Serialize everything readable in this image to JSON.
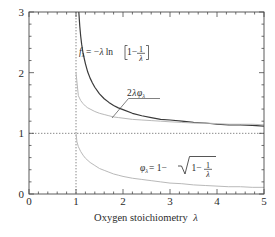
{
  "chart_data": {
    "type": "line",
    "title": "",
    "xlabel": "Oxygen stoichiometry λ",
    "ylabel": "",
    "xlim": [
      0,
      5
    ],
    "ylim": [
      0,
      3
    ],
    "xticks": [
      "0",
      "1",
      "2",
      "3",
      "4",
      "5"
    ],
    "yticks": [
      "0",
      "1",
      "2",
      "3"
    ],
    "xtick_values": [
      0,
      1,
      2,
      3,
      4,
      5
    ],
    "ytick_values": [
      0,
      1,
      2,
      3
    ],
    "xminor_step": 0.2,
    "yminor_step": 0.2,
    "grid": false,
    "legend_position": "inline-annotations",
    "reference_lines": [
      {
        "name": "lambda-equals-one",
        "orientation": "vertical",
        "value": 1,
        "style": "dotted"
      },
      {
        "name": "y-equals-one",
        "orientation": "horizontal",
        "value": 1,
        "style": "dotted"
      }
    ],
    "series": [
      {
        "name": "f_lambda",
        "label": "fλ = −λ ln[1 − 1/λ]",
        "color": "#3a3a3a",
        "width": 1.2,
        "x": [
          1.02,
          1.04,
          1.06,
          1.08,
          1.1,
          1.12,
          1.15,
          1.2,
          1.25,
          1.3,
          1.35,
          1.4,
          1.5,
          1.6,
          1.7,
          1.8,
          1.9,
          2.0,
          2.2,
          2.4,
          2.6,
          2.8,
          3.0,
          3.25,
          3.5,
          3.75,
          4.0,
          4.25,
          4.5,
          4.75,
          5.0
        ],
        "y": [
          3.99,
          3.35,
          3.0,
          2.77,
          2.6,
          2.47,
          2.32,
          2.15,
          2.01,
          1.91,
          1.83,
          1.76,
          1.65,
          1.57,
          1.51,
          1.46,
          1.42,
          1.39,
          1.33,
          1.29,
          1.26,
          1.23,
          1.22,
          1.2,
          1.18,
          1.17,
          1.15,
          1.14,
          1.14,
          1.13,
          1.12
        ]
      },
      {
        "name": "two-lambda-phi",
        "label": "2λφλ",
        "color": "#b9b9b9",
        "width": 1.0,
        "x": [
          1.0,
          1.05,
          1.1,
          1.15,
          1.2,
          1.25,
          1.3,
          1.4,
          1.5,
          1.6,
          1.7,
          1.8,
          1.9,
          2.0,
          2.2,
          2.4,
          2.6,
          2.8,
          3.0,
          3.25,
          3.5,
          3.75,
          4.0,
          4.25,
          4.5,
          4.75,
          5.0
        ],
        "y": [
          2.0,
          1.62,
          1.54,
          1.49,
          1.45,
          1.42,
          1.4,
          1.36,
          1.33,
          1.31,
          1.29,
          1.27,
          1.26,
          1.25,
          1.23,
          1.22,
          1.21,
          1.2,
          1.19,
          1.18,
          1.17,
          1.17,
          1.16,
          1.15,
          1.15,
          1.15,
          1.14
        ]
      },
      {
        "name": "phi_lambda",
        "label": "φλ = 1 − √(1 − 1/λ)",
        "color": "#b9b9b9",
        "width": 1.0,
        "x": [
          1.0,
          1.02,
          1.05,
          1.1,
          1.15,
          1.2,
          1.3,
          1.4,
          1.5,
          1.6,
          1.7,
          1.8,
          1.9,
          2.0,
          2.2,
          2.4,
          2.6,
          2.8,
          3.0,
          3.25,
          3.5,
          3.75,
          4.0,
          4.25,
          4.5,
          4.75,
          5.0
        ],
        "y": [
          1.0,
          0.86,
          0.78,
          0.7,
          0.64,
          0.59,
          0.52,
          0.47,
          0.42,
          0.39,
          0.36,
          0.33,
          0.31,
          0.29,
          0.26,
          0.24,
          0.22,
          0.2,
          0.18,
          0.17,
          0.15,
          0.14,
          0.13,
          0.12,
          0.12,
          0.11,
          0.11
        ]
      }
    ],
    "annotations": [
      {
        "name": "f-lambda-formula",
        "text": "fλ = −λ ln[1 − 1/λ]",
        "x": 1.25,
        "y": 2.45
      },
      {
        "name": "two-lambda-phi-formula",
        "text": "2λφλ",
        "x": 2.25,
        "y": 1.6
      },
      {
        "name": "phi-lambda-formula",
        "text": "φλ = 1 − √(1 − 1/λ)",
        "x": 3.05,
        "y": 0.52
      }
    ]
  },
  "axis": {
    "x_title": "Oxygen stoichiometry",
    "x_title_symbol": "λ",
    "xticks": [
      "0",
      "1",
      "2",
      "3",
      "4",
      "5"
    ],
    "yticks": [
      "0",
      "1",
      "2",
      "3"
    ]
  },
  "labels": {
    "f_lhs": "f",
    "f_sub": "λ",
    "f_eq": "= −",
    "f_lam": "λ",
    "f_ln": "ln",
    "f_one": "1−",
    "f_frac_num": "1",
    "f_frac_den": "λ",
    "mid_two": "2",
    "mid_lam": "λ",
    "mid_phi": "φ",
    "mid_sub": "λ",
    "phi_lhs": "φ",
    "phi_sub": "λ",
    "phi_eq": "= 1−",
    "phi_one": "1−",
    "phi_frac_num": "1",
    "phi_frac_den": "λ"
  },
  "colors": {
    "frame": "#4a4a4a",
    "dark_curve": "#3a3a3a",
    "light_curve": "#bcbcbc",
    "dotted": "#6b6b6b",
    "text": "#2b2b2b"
  }
}
